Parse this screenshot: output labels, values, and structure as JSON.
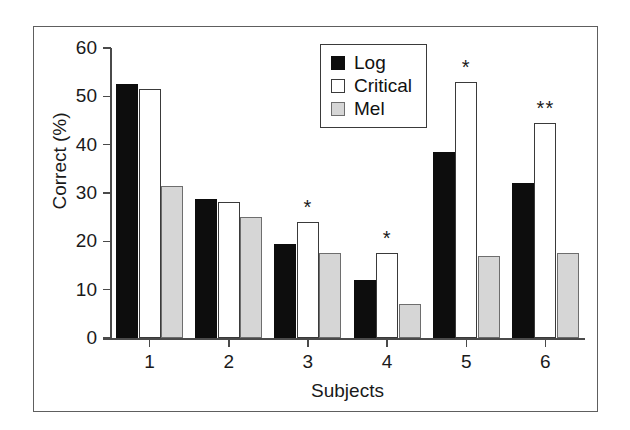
{
  "chart_data": {
    "type": "bar",
    "title": "",
    "xlabel": "Subjects",
    "ylabel": "Correct (%)",
    "categories": [
      "1",
      "2",
      "3",
      "4",
      "5",
      "6"
    ],
    "ylim": [
      0,
      60
    ],
    "yticks": [
      0,
      10,
      20,
      30,
      40,
      50,
      60
    ],
    "xticks": [
      "1",
      "2",
      "3",
      "4",
      "5",
      "6"
    ],
    "grid": false,
    "legend_position": "top-center-right",
    "series": [
      {
        "name": "Log",
        "color": "#0d0d0d",
        "values": [
          52.5,
          28.7,
          19.5,
          12.0,
          38.5,
          32.0
        ]
      },
      {
        "name": "Critical",
        "color": "#ffffff",
        "values": [
          51.5,
          28.2,
          24.0,
          17.5,
          53.0,
          44.5
        ]
      },
      {
        "name": "Mel",
        "color": "#d6d6d6",
        "values": [
          31.5,
          25.0,
          17.5,
          7.0,
          17.0,
          17.5
        ]
      }
    ],
    "annotations": [
      {
        "category": "3",
        "series": "Critical",
        "text": "*"
      },
      {
        "category": "4",
        "series": "Critical",
        "text": "*"
      },
      {
        "category": "5",
        "series": "Critical",
        "text": "*"
      },
      {
        "category": "6",
        "series": "Critical",
        "text": "**"
      }
    ]
  },
  "legend": {
    "items": [
      {
        "label": "Log",
        "swatch": "log"
      },
      {
        "label": "Critical",
        "swatch": "critical"
      },
      {
        "label": "Mel",
        "swatch": "mel"
      }
    ]
  }
}
